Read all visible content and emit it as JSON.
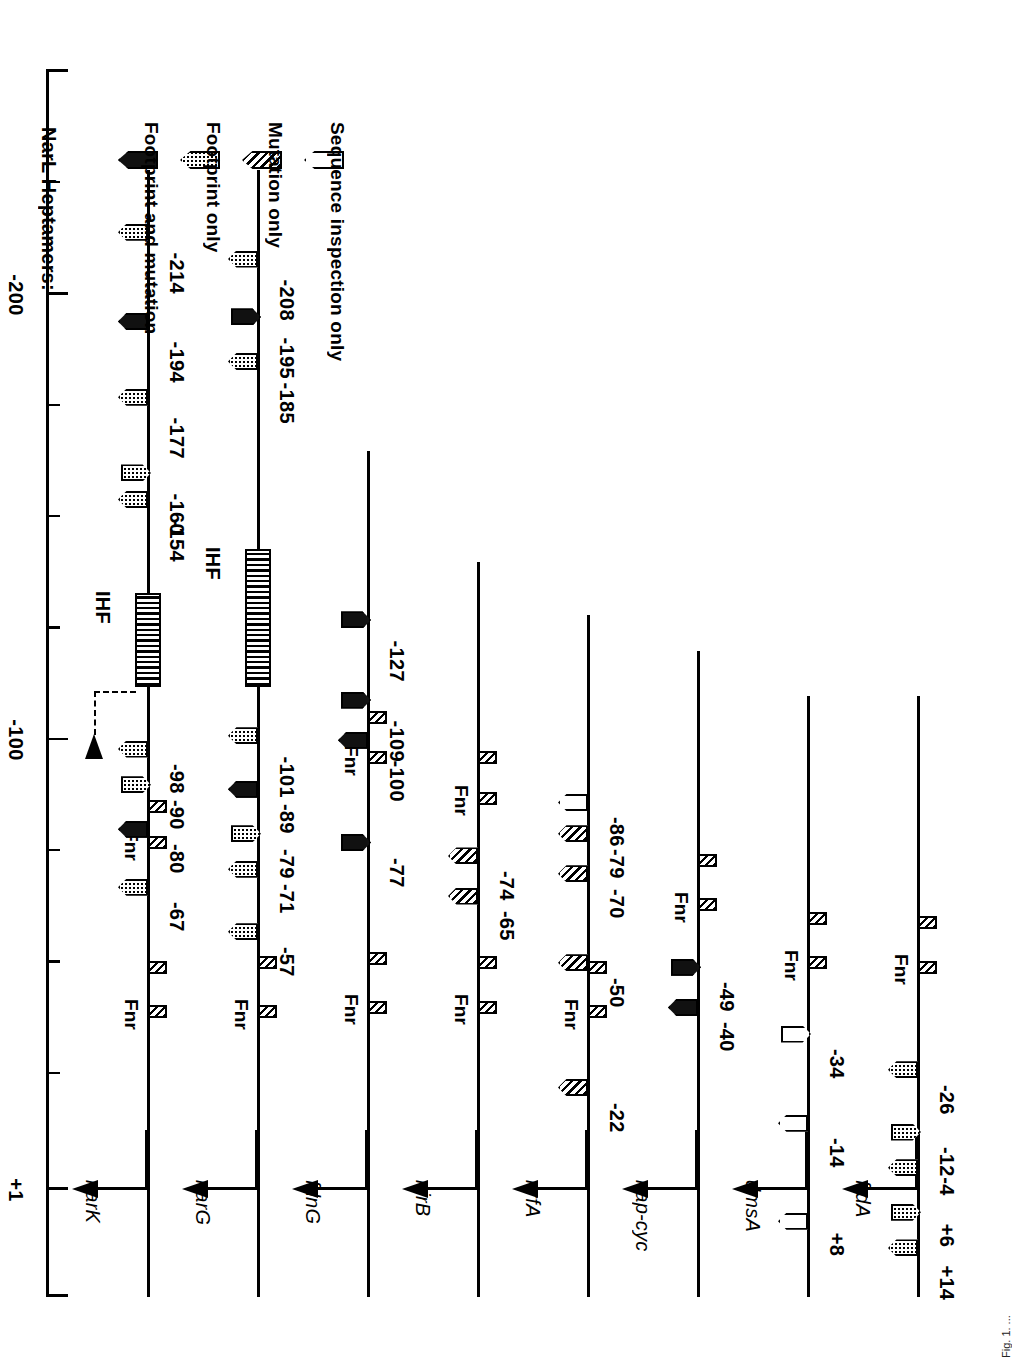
{
  "figure": {
    "orientation": "rotated-90-ccw",
    "caption_fragment": "Fig. 1. ..."
  },
  "axis": {
    "label_plus1": "+1",
    "label_minus100": "-100",
    "label_minus200": "-200",
    "ticks": [
      {
        "value": 25,
        "label": "",
        "major": false
      },
      {
        "value": 1,
        "label": "+1",
        "major": true
      },
      {
        "value": -25,
        "label": "",
        "major": false
      },
      {
        "value": -50,
        "label": "",
        "major": false
      },
      {
        "value": -75,
        "label": "",
        "major": false
      },
      {
        "value": -100,
        "label": "-100",
        "major": true
      },
      {
        "value": -125,
        "label": "",
        "major": false
      },
      {
        "value": -150,
        "label": "",
        "major": false
      },
      {
        "value": -175,
        "label": "",
        "major": false
      },
      {
        "value": -200,
        "label": "-200",
        "major": true
      },
      {
        "value": -225,
        "label": "",
        "major": false
      }
    ]
  },
  "legend": {
    "title": "NarL Heptamers:",
    "items": [
      {
        "label": "Footprint and mutation",
        "style": "solid"
      },
      {
        "label": "Footprint only",
        "style": "dot"
      },
      {
        "label": "Mutation only",
        "style": "hatch"
      },
      {
        "label": "Sequence inspection only",
        "style": "open"
      }
    ]
  },
  "fnr_label": "Fnr",
  "ihf_label": "IHF",
  "promoters": [
    {
      "gene": "narK",
      "dna_start": -228,
      "heptamers": [
        {
          "pos": -67,
          "style": "dot",
          "dir": "up",
          "label": "-67"
        },
        {
          "pos": -80,
          "style": "solid",
          "dir": "up",
          "label": "-80"
        },
        {
          "pos": -90,
          "style": "dot",
          "dir": "down",
          "label": "-90"
        },
        {
          "pos": -98,
          "style": "dot",
          "dir": "up",
          "label": "-98"
        },
        {
          "pos": -154,
          "style": "dot",
          "dir": "up",
          "label": "-154"
        },
        {
          "pos": -160,
          "style": "dot",
          "dir": "down",
          "label": "-160"
        },
        {
          "pos": -177,
          "style": "dot",
          "dir": "up",
          "label": "-177"
        },
        {
          "pos": -194,
          "style": "solid",
          "dir": "up",
          "label": "-194"
        },
        {
          "pos": -214,
          "style": "dot",
          "dir": "up",
          "label": "-214"
        }
      ],
      "fnr_sites": [
        {
          "pos": -39,
          "label": "Fnr"
        },
        {
          "pos": -49,
          "label": ""
        },
        {
          "pos": -77,
          "label": "Fnr"
        },
        {
          "pos": -85,
          "label": ""
        }
      ],
      "ihf": [
        {
          "start": -133,
          "end": -112,
          "label": "IHF"
        }
      ],
      "bend_arrow": true
    },
    {
      "gene": "narG",
      "dna_start": -228,
      "heptamers": [
        {
          "pos": -57,
          "style": "dot",
          "dir": "up",
          "label": "-57"
        },
        {
          "pos": -71,
          "style": "dot",
          "dir": "up",
          "label": "-71"
        },
        {
          "pos": -79,
          "style": "dot",
          "dir": "down",
          "label": "-79"
        },
        {
          "pos": -89,
          "style": "solid",
          "dir": "up",
          "label": "-89"
        },
        {
          "pos": -101,
          "style": "dot",
          "dir": "up",
          "label": "-101"
        },
        {
          "pos": -185,
          "style": "dot",
          "dir": "up",
          "label": "-185"
        },
        {
          "pos": -195,
          "style": "solid",
          "dir": "down",
          "label": "-195"
        },
        {
          "pos": -208,
          "style": "dot",
          "dir": "up",
          "label": "-208"
        }
      ],
      "fnr_sites": [
        {
          "pos": -39,
          "label": "Fnr"
        },
        {
          "pos": -50,
          "label": ""
        }
      ],
      "ihf": [
        {
          "start": -143,
          "end": -112,
          "label": "IHF"
        }
      ],
      "bend_arrow": false
    },
    {
      "gene": "fdnG",
      "dna_start": -165,
      "heptamers": [
        {
          "pos": -77,
          "style": "solid",
          "dir": "down",
          "label": "-77"
        },
        {
          "pos": -100,
          "style": "solid",
          "dir": "up",
          "label": "-100"
        },
        {
          "pos": -109,
          "style": "solid",
          "dir": "down",
          "label": "-109"
        },
        {
          "pos": -127,
          "style": "solid",
          "dir": "down",
          "label": "-127"
        }
      ],
      "fnr_sites": [
        {
          "pos": -40,
          "label": "Fnr"
        },
        {
          "pos": -51,
          "label": ""
        },
        {
          "pos": -96,
          "label": "Fnr"
        },
        {
          "pos": -105,
          "label": ""
        }
      ],
      "ihf": [],
      "bend_arrow": false
    },
    {
      "gene": "nirB",
      "dna_start": -140,
      "heptamers": [
        {
          "pos": -65,
          "style": "hatch",
          "dir": "up",
          "label": "-65"
        },
        {
          "pos": -74,
          "style": "hatch",
          "dir": "up",
          "label": "-74"
        }
      ],
      "fnr_sites": [
        {
          "pos": -40,
          "label": "Fnr"
        },
        {
          "pos": -50,
          "label": ""
        },
        {
          "pos": -87,
          "label": "Fnr"
        },
        {
          "pos": -96,
          "label": ""
        }
      ],
      "ihf": [],
      "bend_arrow": false
    },
    {
      "gene": "nrfA",
      "dna_start": -128,
      "heptamers": [
        {
          "pos": -22,
          "style": "hatch",
          "dir": "up",
          "label": "-22"
        },
        {
          "pos": -50,
          "style": "hatch",
          "dir": "up",
          "label": "-50"
        },
        {
          "pos": -70,
          "style": "hatch",
          "dir": "up",
          "label": "-70"
        },
        {
          "pos": -79,
          "style": "hatch",
          "dir": "up",
          "label": "-79"
        },
        {
          "pos": -86,
          "style": "open",
          "dir": "up",
          "label": "-86"
        }
      ],
      "fnr_sites": [
        {
          "pos": -39,
          "label": "Fnr"
        },
        {
          "pos": -49,
          "label": ""
        }
      ],
      "ihf": [],
      "bend_arrow": false
    },
    {
      "gene": "nap-cyc",
      "dna_start": -120,
      "heptamers": [
        {
          "pos": -40,
          "style": "solid",
          "dir": "up",
          "label": "-40"
        },
        {
          "pos": -49,
          "style": "solid",
          "dir": "down",
          "label": "-49"
        }
      ],
      "fnr_sites": [
        {
          "pos": -63,
          "label": "Fnr"
        },
        {
          "pos": -73,
          "label": ""
        }
      ],
      "ihf": [],
      "bend_arrow": false
    },
    {
      "gene": "dmsA",
      "dna_start": -110,
      "heptamers": [
        {
          "pos": 8,
          "style": "open",
          "dir": "up",
          "label": "+8"
        },
        {
          "pos": -14,
          "style": "open",
          "dir": "up",
          "label": "-14"
        },
        {
          "pos": -34,
          "style": "open",
          "dir": "down",
          "label": "-34"
        }
      ],
      "fnr_sites": [
        {
          "pos": -50,
          "label": "Fnr"
        },
        {
          "pos": -60,
          "label": ""
        }
      ],
      "ihf": [],
      "bend_arrow": false
    },
    {
      "gene": "frdA",
      "dna_start": -110,
      "heptamers": [
        {
          "pos": 14,
          "style": "dot",
          "dir": "up",
          "label": "+14"
        },
        {
          "pos": 6,
          "style": "dot",
          "dir": "down",
          "label": "+6"
        },
        {
          "pos": -4,
          "style": "dot",
          "dir": "up",
          "label": "-4"
        },
        {
          "pos": -12,
          "style": "dot",
          "dir": "down",
          "label": "-12"
        },
        {
          "pos": -26,
          "style": "dot",
          "dir": "up",
          "label": "-26"
        }
      ],
      "fnr_sites": [
        {
          "pos": -49,
          "label": "Fnr"
        },
        {
          "pos": -59,
          "label": ""
        }
      ],
      "ihf": [],
      "bend_arrow": false
    }
  ]
}
